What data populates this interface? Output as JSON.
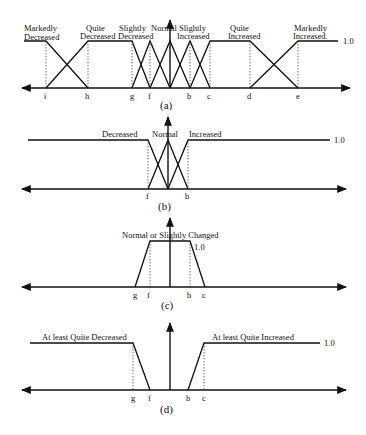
{
  "figure": {
    "panels": [
      {
        "id": "a",
        "caption": "(a)",
        "top_value_label": "1.0",
        "tick_labels": [
          "i",
          "h",
          "g",
          "f",
          "b",
          "c",
          "d",
          "e"
        ],
        "sets": [
          {
            "line1": "Markedly",
            "line2": "Decreased"
          },
          {
            "line1": "Quite",
            "line2": "Decreased"
          },
          {
            "line1": "Slightly",
            "line2": "Decreased"
          },
          {
            "line1": "Normal",
            "line2": ""
          },
          {
            "line1": "Slightly",
            "line2": "Increased"
          },
          {
            "line1": "Quite",
            "line2": "Increased"
          },
          {
            "line1": "Markedly",
            "line2": "Increased."
          }
        ]
      },
      {
        "id": "b",
        "caption": "(b)",
        "top_value_label": "1.0",
        "tick_labels": [
          "f",
          "b"
        ],
        "sets": [
          {
            "label": "Decreased"
          },
          {
            "label": "Normal"
          },
          {
            "label": "Increased"
          }
        ]
      },
      {
        "id": "c",
        "caption": "(c)",
        "top_value_label": "1.0",
        "tick_labels": [
          "g",
          "f",
          "b",
          "c"
        ],
        "sets": [
          {
            "label": "Normal or Slightly Changed"
          }
        ]
      },
      {
        "id": "d",
        "caption": "(d)",
        "top_value_label": "1.0",
        "tick_labels": [
          "g",
          "f",
          "b",
          "c"
        ],
        "sets": [
          {
            "label": "At least Quite Decreased"
          },
          {
            "label": "At least Quite Increased"
          }
        ]
      }
    ]
  }
}
